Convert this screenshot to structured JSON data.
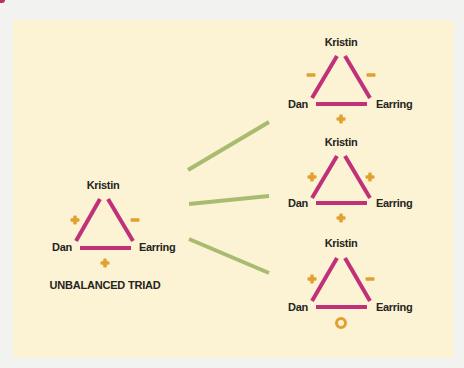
{
  "colors": {
    "background": "#f2f3f1",
    "panel": "#fbf3d3",
    "relation_line": "#c0317a",
    "sign": "#e2a030",
    "connector": "#a8bb6e",
    "text": "#262421"
  },
  "unbalanced": {
    "title": "UNBALANCED TRIAD",
    "nodes": {
      "top": "Kristin",
      "left": "Dan",
      "right": "Earring"
    },
    "signs": {
      "left_edge": "+",
      "right_edge": "−",
      "bottom_edge": "+"
    }
  },
  "resolutions": [
    {
      "nodes": {
        "top": "Kristin",
        "left": "Dan",
        "right": "Earring"
      },
      "signs": {
        "left_edge": "−",
        "right_edge": "−",
        "bottom_edge": "+"
      }
    },
    {
      "nodes": {
        "top": "Kristin",
        "left": "Dan",
        "right": "Earring"
      },
      "signs": {
        "left_edge": "+",
        "right_edge": "+",
        "bottom_edge": "+"
      }
    },
    {
      "nodes": {
        "top": "Kristin",
        "left": "Dan",
        "right": "Earring"
      },
      "signs": {
        "left_edge": "+",
        "right_edge": "−",
        "bottom_edge": "o"
      }
    }
  ],
  "icons": {
    "plus": "plus-sign-icon",
    "minus": "minus-sign-icon",
    "zero": "circle-zero-icon"
  }
}
